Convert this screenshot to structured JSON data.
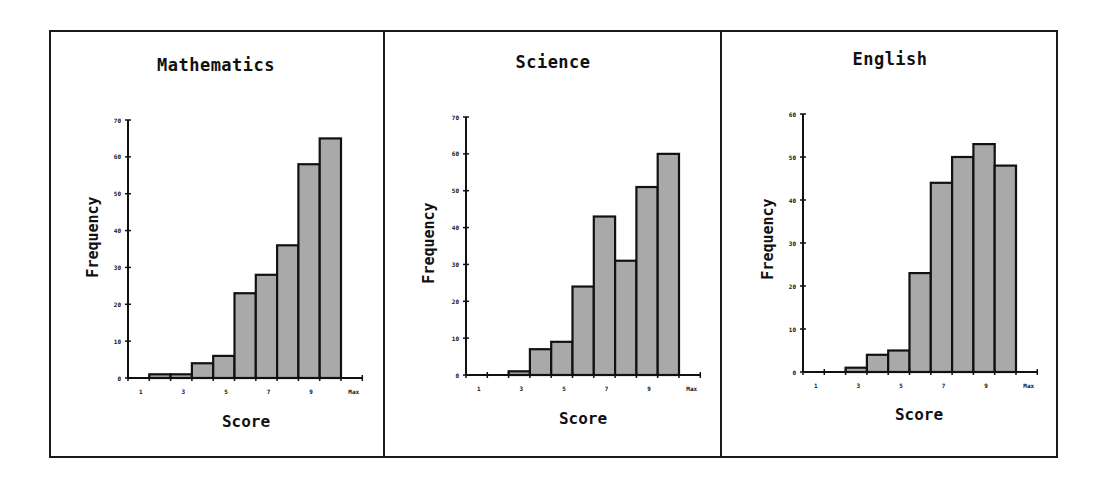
{
  "chart_data": [
    {
      "type": "bar",
      "title": "Mathematics",
      "xlabel": "Score",
      "ylabel": "Frequency",
      "x_tick_labels": [
        "1",
        "3",
        "5",
        "7",
        "9",
        "Max"
      ],
      "y_ticks": [
        0,
        10,
        20,
        30,
        40,
        50,
        60,
        70
      ],
      "ylim": [
        0,
        70
      ],
      "grid": false,
      "bins": 10,
      "categories": [
        "bin1",
        "bin2",
        "bin3",
        "bin4",
        "bin5",
        "bin6",
        "bin7",
        "bin8",
        "bin9",
        "bin10"
      ],
      "values": [
        0,
        1,
        1,
        4,
        6,
        23,
        28,
        36,
        58,
        65
      ]
    },
    {
      "type": "bar",
      "title": "Science",
      "xlabel": "Score",
      "ylabel": "Frequency",
      "x_tick_labels": [
        "1",
        "3",
        "5",
        "7",
        "9",
        "Max"
      ],
      "y_ticks": [
        0,
        10,
        20,
        30,
        40,
        50,
        60,
        70
      ],
      "ylim": [
        0,
        70
      ],
      "grid": false,
      "bins": 10,
      "categories": [
        "bin1",
        "bin2",
        "bin3",
        "bin4",
        "bin5",
        "bin6",
        "bin7",
        "bin8",
        "bin9",
        "bin10"
      ],
      "values": [
        0,
        0,
        1,
        7,
        9,
        24,
        43,
        31,
        51,
        60
      ]
    },
    {
      "type": "bar",
      "title": "English",
      "xlabel": "Score",
      "ylabel": "Frequency",
      "x_tick_labels": [
        "1",
        "3",
        "5",
        "7",
        "9",
        "Max"
      ],
      "y_ticks": [
        0,
        10,
        20,
        30,
        40,
        50,
        60
      ],
      "ylim": [
        0,
        60
      ],
      "grid": false,
      "bins": 10,
      "categories": [
        "bin1",
        "bin2",
        "bin3",
        "bin4",
        "bin5",
        "bin6",
        "bin7",
        "bin8",
        "bin9",
        "bin10"
      ],
      "values": [
        0,
        0,
        1,
        4,
        5,
        23,
        44,
        50,
        53,
        48
      ]
    }
  ],
  "panels": [
    {
      "title": "Mathematics",
      "xlabel": "Score",
      "ylabel": "Frequency"
    },
    {
      "title": "Science",
      "xlabel": "Score",
      "ylabel": "Frequency"
    },
    {
      "title": "English",
      "xlabel": "Score",
      "ylabel": "Frequency"
    }
  ],
  "colors": {
    "bar_fill": "#a9a9a9",
    "bar_stroke": "#111111",
    "axis": "#111111",
    "frame": "#1a1a1a"
  }
}
